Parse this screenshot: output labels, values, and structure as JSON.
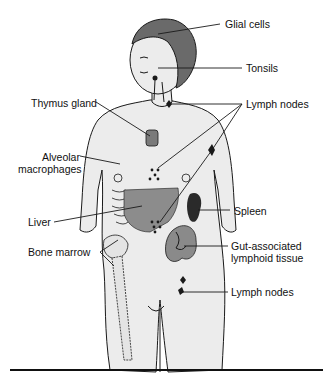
{
  "figure": {
    "type": "anatomical-diagram"
  },
  "labels": {
    "glial_cells": "Glial cells",
    "tonsils": "Tonsils",
    "thymus_gland": "Thymus gland",
    "lymph_nodes_upper": "Lymph nodes",
    "alveolar_macrophages_1": "Alveolar",
    "alveolar_macrophages_2": "macrophages",
    "liver": "Liver",
    "spleen": "Spleen",
    "bone_marrow": "Bone marrow",
    "galt_1": "Gut-associated",
    "galt_2": "lymphoid tissue",
    "lymph_nodes_lower": "Lymph nodes"
  },
  "colors": {
    "background": "#ffffff",
    "skin": "#ececec",
    "outline": "#1a1a1a",
    "hair": "#6a6a6a",
    "organ_dark": "#2a2a2a",
    "organ_mid": "#8a8a8a",
    "liver": "#8c8c8c",
    "bone": "#e4e4e4"
  }
}
